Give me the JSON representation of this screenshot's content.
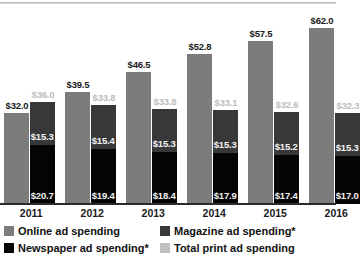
{
  "chart_data": {
    "type": "bar",
    "title": "",
    "subtitle": "",
    "xlabel": "",
    "ylabel": "",
    "ylim": [
      0,
      69
    ],
    "grid": false,
    "legend_position": "bottom",
    "categories": [
      "2011",
      "2012",
      "2013",
      "2014",
      "2015",
      "2016"
    ],
    "series": [
      {
        "name": "Online ad spending",
        "color": "#7c7c7c",
        "values": [
          32.0,
          39.5,
          46.5,
          52.8,
          57.5,
          62.0
        ],
        "labels": [
          "$32.0",
          "$39.5",
          "$46.5",
          "$52.8",
          "$57.5",
          "$62.0"
        ]
      },
      {
        "name": "Magazine ad spending*",
        "color": "#383838",
        "stacked_in": "Total print ad spending",
        "values": [
          15.3,
          15.4,
          15.3,
          15.3,
          15.2,
          15.3
        ],
        "labels": [
          "$15.3",
          "$15.4",
          "$15.3",
          "$15.3",
          "$15.2",
          "$15.3"
        ]
      },
      {
        "name": "Newspaper ad spending*",
        "color": "#050505",
        "stacked_in": "Total print ad spending",
        "values": [
          20.7,
          19.4,
          18.4,
          17.9,
          17.4,
          17.0
        ],
        "labels": [
          "$20.7",
          "$19.4",
          "$18.4",
          "$17.9",
          "$17.4",
          "$17.0"
        ]
      },
      {
        "name": "Total print ad spending",
        "color": "#bfbfbf",
        "is_total": true,
        "values": [
          36.0,
          33.8,
          33.8,
          33.1,
          32.6,
          32.3
        ],
        "labels": [
          "$36.0",
          "$33.8",
          "$33.8",
          "$33.1",
          "$32.6",
          "$32.3"
        ]
      }
    ],
    "legend": [
      {
        "label": "Online ad spending",
        "swatch": "online"
      },
      {
        "label": "Magazine ad spending*",
        "swatch": "magazine"
      },
      {
        "label": "Newspaper ad spending*",
        "swatch": "newspaper"
      },
      {
        "label": "Total print ad spending",
        "swatch": "totalprint"
      }
    ]
  }
}
